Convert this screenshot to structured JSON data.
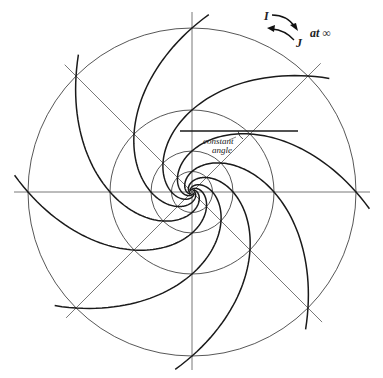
{
  "figure": {
    "type": "logarithmic spiral diagram",
    "center": [
      192,
      192
    ],
    "circle_radii": [
      164,
      82,
      41,
      20.5
    ],
    "radial_line_angles_deg": [
      0,
      45,
      90,
      135
    ],
    "spiral_arm_count": 8,
    "spiral_growth": "radius halves per 45 degrees of rotation",
    "colors": {
      "lines": "#1a1a1a",
      "guides": "#555555",
      "background": "#ffffff"
    }
  },
  "labels": {
    "constant_angle_line1": "constant",
    "constant_angle_line2": "angle",
    "circular_point_i": "I",
    "circular_point_j": "J",
    "at_infinity": "at ∞"
  },
  "tangent_line": {
    "x1": 180,
    "x2": 298,
    "y": 131,
    "touch_point": [
      248,
      131
    ]
  }
}
